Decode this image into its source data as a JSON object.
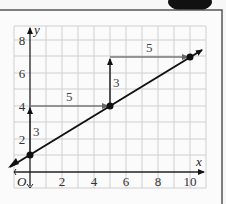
{
  "diagram": {
    "type": "coordinate-graph",
    "axes": {
      "x_label": "x",
      "y_label": "y",
      "origin_label": "O",
      "x_ticks": [
        "2",
        "4",
        "6",
        "8",
        "10"
      ],
      "y_ticks": [
        "2",
        "4",
        "6",
        "8"
      ]
    },
    "line": {
      "slope": "3/5",
      "y_intercept": 1
    },
    "points": [
      {
        "x": 0,
        "y": 1
      },
      {
        "x": 5,
        "y": 4
      },
      {
        "x": 10,
        "y": 7
      }
    ],
    "steps": [
      {
        "type": "rise",
        "label": "3",
        "from": [
          0,
          1
        ],
        "to": [
          0,
          4
        ]
      },
      {
        "type": "run",
        "label": "5",
        "from": [
          0,
          4
        ],
        "to": [
          5,
          4
        ]
      },
      {
        "type": "rise",
        "label": "3",
        "from": [
          5,
          4
        ],
        "to": [
          5,
          7
        ]
      },
      {
        "type": "run",
        "label": "5",
        "from": [
          5,
          7
        ],
        "to": [
          10,
          7
        ]
      }
    ]
  }
}
